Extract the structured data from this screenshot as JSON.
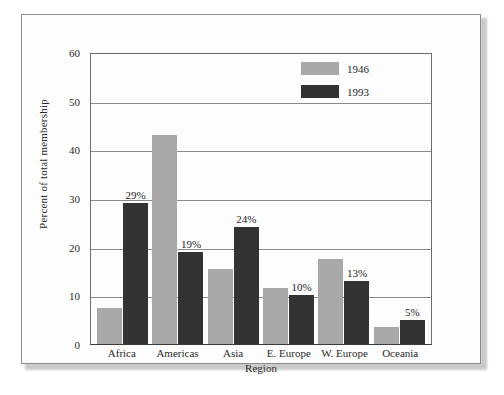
{
  "chart_data": {
    "type": "bar",
    "title": "",
    "xlabel": "Region",
    "ylabel": "Percent of total membership",
    "categories": [
      "Africa",
      "Americas",
      "Asia",
      "E. Europe",
      "W. Europe",
      "Oceania"
    ],
    "series": [
      {
        "name": "1946",
        "color": "#a8a8a8",
        "values": [
          7.5,
          43,
          15.5,
          11.5,
          17.5,
          3.5
        ],
        "point_labels": [
          "",
          "",
          "",
          "",
          "",
          ""
        ]
      },
      {
        "name": "1993",
        "color": "#333333",
        "values": [
          29,
          19,
          24,
          10,
          13,
          5
        ],
        "point_labels": [
          "29%",
          "19%",
          "24%",
          "10%",
          "13%",
          "5%"
        ]
      }
    ],
    "ylim": [
      0,
      60
    ],
    "yticks": [
      0,
      10,
      20,
      30,
      40,
      50,
      60
    ],
    "ytick_labels": [
      "0",
      "10",
      "20",
      "30",
      "40",
      "50",
      "60"
    ],
    "grid": true,
    "grid_axis": "y",
    "legend_position": "top-right-inside"
  },
  "legend": {
    "entries": [
      {
        "label": "1946",
        "color": "#a8a8a8"
      },
      {
        "label": "1993",
        "color": "#333333"
      }
    ]
  },
  "colors": {
    "series_1946": "#a8a8a8",
    "series_1993": "#333333",
    "gridline": "#8a8a8a",
    "axis": "#3a3a3a",
    "frame_border": "#8d8d8d",
    "page_background": "#fdfdfd"
  }
}
